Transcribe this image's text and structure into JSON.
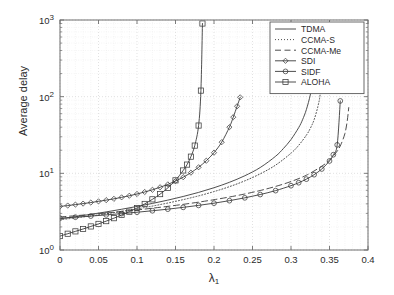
{
  "chart_data": {
    "type": "line",
    "title": "",
    "xlabel": "λ₁",
    "ylabel": "Average delay",
    "xlim": [
      0,
      0.4
    ],
    "ylim": [
      1,
      1000
    ],
    "yscale": "log",
    "xscale": "linear",
    "grid": true,
    "legend_position": "top-right",
    "xticks": [
      "0",
      "0.05",
      "0.1",
      "0.15",
      "0.2",
      "0.25",
      "0.3",
      "0.35",
      "0.4"
    ],
    "xtick_values": [
      0,
      0.05,
      0.1,
      0.15,
      0.2,
      0.25,
      0.3,
      0.35,
      0.4
    ],
    "ytick_labels": [
      "10⁰",
      "10¹",
      "10²",
      "10³"
    ],
    "ytick_values": [
      1,
      10,
      100,
      1000
    ],
    "series": [
      {
        "name": "TDMA",
        "style": "solid",
        "marker": "none",
        "color": "#3a3a3a",
        "asymptote": 0.335,
        "x": [
          0.0,
          0.02,
          0.04,
          0.06,
          0.08,
          0.1,
          0.12,
          0.14,
          0.16,
          0.18,
          0.2,
          0.22,
          0.24,
          0.26,
          0.28,
          0.29,
          0.3,
          0.31,
          0.315,
          0.32,
          0.325,
          0.328,
          0.331,
          0.333
        ],
        "y": [
          2.55,
          2.72,
          2.92,
          3.14,
          3.4,
          3.7,
          4.05,
          4.47,
          4.99,
          5.64,
          6.49,
          7.64,
          9.3,
          11.9,
          16.7,
          21.0,
          27.6,
          39.5,
          50.0,
          68.0,
          105.0,
          160.0,
          320.0,
          900.0
        ]
      },
      {
        "name": "CCMA-S",
        "style": "dotted",
        "marker": "none",
        "color": "#3a3a3a",
        "asymptote": 0.345,
        "x": [
          0.0,
          0.02,
          0.04,
          0.06,
          0.08,
          0.1,
          0.12,
          0.14,
          0.16,
          0.18,
          0.2,
          0.22,
          0.24,
          0.26,
          0.28,
          0.3,
          0.31,
          0.32,
          0.325,
          0.33,
          0.335,
          0.338,
          0.341,
          0.343
        ],
        "y": [
          2.48,
          2.62,
          2.78,
          2.97,
          3.19,
          3.44,
          3.74,
          4.1,
          4.54,
          5.08,
          5.78,
          6.7,
          7.98,
          9.85,
          12.8,
          18.3,
          23.2,
          31.5,
          38.5,
          50.0,
          75.0,
          110.0,
          240.0,
          700.0
        ]
      },
      {
        "name": "CCMA-Me",
        "style": "dashed",
        "marker": "none",
        "color": "#3a3a3a",
        "asymptote": 0.377,
        "x": [
          0.0,
          0.02,
          0.04,
          0.06,
          0.08,
          0.1,
          0.12,
          0.14,
          0.16,
          0.18,
          0.2,
          0.22,
          0.24,
          0.26,
          0.28,
          0.3,
          0.32,
          0.34,
          0.35,
          0.36,
          0.365,
          0.37,
          0.373,
          0.375
        ],
        "y": [
          2.7,
          2.8,
          2.91,
          3.04,
          3.18,
          3.33,
          3.51,
          3.71,
          3.94,
          4.21,
          4.53,
          4.91,
          5.38,
          5.97,
          6.75,
          7.82,
          9.45,
          12.4,
          14.9,
          19.5,
          24.0,
          33.0,
          48.0,
          72.0
        ]
      },
      {
        "name": "SDI",
        "style": "solid",
        "marker": "diamond",
        "color": "#3a3a3a",
        "asymptote": 0.238,
        "x": [
          0.0,
          0.01,
          0.02,
          0.03,
          0.04,
          0.05,
          0.06,
          0.07,
          0.08,
          0.09,
          0.1,
          0.11,
          0.12,
          0.13,
          0.14,
          0.15,
          0.16,
          0.17,
          0.18,
          0.19,
          0.2,
          0.21,
          0.22,
          0.225,
          0.23,
          0.234
        ],
        "y": [
          3.7,
          3.8,
          3.91,
          4.03,
          4.16,
          4.31,
          4.47,
          4.65,
          4.86,
          5.1,
          5.38,
          5.71,
          6.1,
          6.58,
          7.17,
          7.92,
          8.9,
          10.2,
          12.0,
          14.6,
          18.6,
          25.5,
          40.0,
          54.0,
          75.0,
          98.0
        ]
      },
      {
        "name": "SIDF",
        "style": "solid",
        "marker": "circle",
        "color": "#3a3a3a",
        "asymptote": 0.368,
        "x": [
          0.0,
          0.02,
          0.04,
          0.06,
          0.08,
          0.1,
          0.12,
          0.14,
          0.16,
          0.18,
          0.2,
          0.22,
          0.24,
          0.26,
          0.28,
          0.3,
          0.31,
          0.32,
          0.33,
          0.34,
          0.35,
          0.355,
          0.36,
          0.364
        ],
        "y": [
          2.6,
          2.68,
          2.77,
          2.87,
          2.98,
          3.11,
          3.25,
          3.41,
          3.6,
          3.82,
          4.08,
          4.4,
          4.79,
          5.29,
          5.95,
          6.9,
          7.55,
          8.4,
          9.6,
          11.4,
          14.5,
          17.5,
          23.5,
          88.0
        ]
      },
      {
        "name": "ALOHA",
        "style": "solid",
        "marker": "square",
        "color": "#3a3a3a",
        "asymptote": 0.188,
        "x": [
          0.0,
          0.01,
          0.02,
          0.03,
          0.04,
          0.05,
          0.06,
          0.07,
          0.08,
          0.09,
          0.1,
          0.11,
          0.12,
          0.13,
          0.14,
          0.15,
          0.16,
          0.165,
          0.17,
          0.175,
          0.18,
          0.183,
          0.185
        ],
        "y": [
          1.52,
          1.63,
          1.75,
          1.88,
          2.03,
          2.19,
          2.38,
          2.6,
          2.86,
          3.16,
          3.53,
          3.99,
          4.58,
          5.36,
          6.45,
          8.1,
          10.9,
          13.0,
          16.5,
          23.0,
          42.0,
          120.0,
          900.0
        ]
      }
    ],
    "legend_entries": [
      "TDMA",
      "CCMA-S",
      "CCMA-Me",
      "SDI",
      "SIDF",
      "ALOHA"
    ]
  },
  "colors": {
    "axis": "#6e6e6e",
    "grid_major": "#d6d6d6",
    "grid_minor": "#e8e8e8",
    "line": "#3a3a3a",
    "background": "#ffffff",
    "text": "#2b2b2b"
  }
}
